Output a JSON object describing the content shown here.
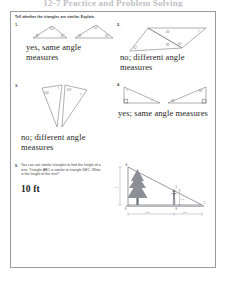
{
  "page": {
    "header_title": "12-7 Practice and Problem Solving"
  },
  "worksheet": {
    "instruction": "Tell whether the triangles are similar. Explain.",
    "problems": [
      {
        "number": "1.",
        "answer": "yes, same angle measures",
        "figure": {
          "name": "two-similar-acute-triangles",
          "triangle_a_angles": [
            "112°",
            "34°",
            "34°"
          ],
          "triangle_b_angles": [
            "112°",
            "34°",
            "34°"
          ]
        }
      },
      {
        "number": "2.",
        "answer": "no; different angle measures",
        "figure": {
          "name": "two-joined-triangles",
          "triangle_a_angles": [
            "40°",
            "52°",
            "88°"
          ],
          "triangle_b_angles": [
            "40°",
            "60°",
            "80°"
          ]
        }
      },
      {
        "number": "3.",
        "answer": "no; different angle measures",
        "figure": {
          "name": "two-narrow-triangles",
          "triangle_a_angles": [
            "100°",
            "40°",
            "40°"
          ],
          "triangle_b_angles": [
            "110°",
            "35°",
            "35°"
          ]
        }
      },
      {
        "number": "4.",
        "answer": "yes; same angle measures",
        "figure": {
          "name": "two-right-triangles",
          "triangle_a_angles": [
            "30°",
            "60°",
            "90°"
          ],
          "triangle_b_angles": [
            "30°",
            "60°",
            "90°"
          ]
        }
      },
      {
        "number": "5.",
        "text": "You can use similar triangles to find the height of a tree. Triangle ABC is similar to triangle DEC. What is the height of the tree?",
        "answer": "10 ft",
        "figure": {
          "name": "tree-shadow-similar-triangles",
          "vertex_labels": [
            "A",
            "B",
            "C",
            "D",
            "E"
          ],
          "tree_height_label": "? ft",
          "person_height_label": "5 ft",
          "base_segment_1": "12 ft",
          "base_segment_2": "12 ft"
        }
      }
    ]
  }
}
